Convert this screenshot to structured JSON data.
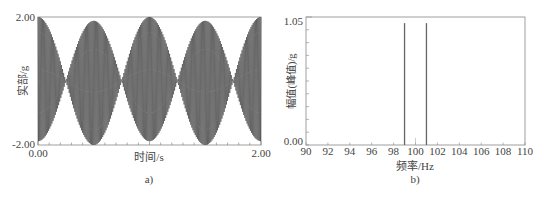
{
  "chart_data": [
    {
      "type": "line",
      "panel_label": "a)",
      "title": "",
      "xlabel": "时间/s",
      "ylabel": "实部/g",
      "xlim": [
        0.0,
        2.0
      ],
      "ylim": [
        -2.0,
        2.0
      ],
      "xtick_labels": [
        "0.00",
        "2.00"
      ],
      "ytick_labels": [
        "2.00",
        "-2.00"
      ],
      "grid": false,
      "series": [
        {
          "name": "beat signal",
          "description": "Sum of two unit-amplitude sinusoids at 99 Hz and 101 Hz producing a 2 Hz beat envelope",
          "components_hz": [
            99,
            101
          ],
          "component_amplitude": 1.0,
          "envelope_peak": 2.0,
          "envelope_nodes_s": [
            0.25,
            0.75,
            1.25,
            1.75
          ],
          "envelope_peaks_s": [
            0.0,
            0.5,
            1.0,
            1.5,
            2.0
          ]
        }
      ]
    },
    {
      "type": "bar",
      "panel_label": "b)",
      "title": "",
      "xlabel": "频率/Hz",
      "ylabel": "幅值(峰值)/g",
      "xlim": [
        90,
        110
      ],
      "ylim": [
        0.0,
        1.05
      ],
      "xtick_labels": [
        "90",
        "92",
        "94",
        "96",
        "98",
        "100",
        "102",
        "104",
        "106",
        "108",
        "110"
      ],
      "ytick_labels": [
        "1.05",
        "0.00"
      ],
      "grid": false,
      "x": [
        99,
        101
      ],
      "values": [
        1.0,
        1.0
      ]
    }
  ],
  "panel_a": {
    "ytick_top": "2.00",
    "ytick_bottom": "-2.00",
    "xtick_left": "0.00",
    "xtick_right": "2.00",
    "xlabel": "时间/s",
    "ylabel": "实部/g",
    "caption": "a)"
  },
  "panel_b": {
    "ytick_top": "1.05",
    "ytick_bottom": "0.00",
    "xticks": [
      "90",
      "92",
      "94",
      "96",
      "98",
      "100",
      "102",
      "104",
      "106",
      "108",
      "110"
    ],
    "xlabel": "频率/Hz",
    "ylabel": "幅值(峰值)/g",
    "caption": "b)"
  }
}
